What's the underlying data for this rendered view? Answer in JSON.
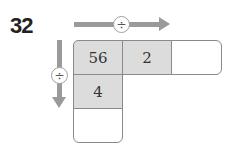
{
  "problem": {
    "number": "32",
    "horizontal_operator": "÷",
    "vertical_operator": "÷",
    "cells": {
      "top_left": "56",
      "top_middle": "2",
      "top_right": "",
      "middle_left": "4",
      "bottom_left": ""
    }
  }
}
